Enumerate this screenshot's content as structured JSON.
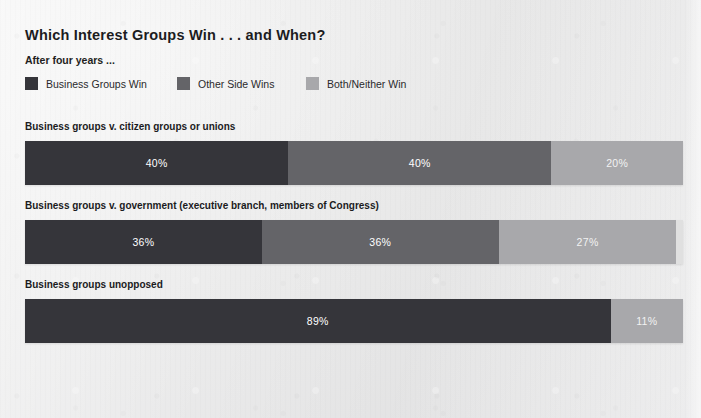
{
  "header": {
    "title": "Which Interest Groups Win . . . and When?",
    "subtitle": "After four years ..."
  },
  "legend": [
    {
      "label": "Business Groups Win",
      "color": "#35353a",
      "key": "business"
    },
    {
      "label": "Other Side Wins",
      "color": "#646468",
      "key": "other"
    },
    {
      "label": "Both/Neither Win",
      "color": "#a8a8ab",
      "key": "both"
    }
  ],
  "groups": [
    {
      "label": "Business groups v. citizen groups or unions",
      "segments": [
        {
          "key": "business",
          "value": 40,
          "label": "40%",
          "color": "#35353a"
        },
        {
          "key": "other",
          "value": 40,
          "label": "40%",
          "color": "#646468"
        },
        {
          "key": "both",
          "value": 20,
          "label": "20%",
          "color": "#a8a8ab"
        }
      ]
    },
    {
      "label": "Business groups v. government (executive branch, members of Congress)",
      "segments": [
        {
          "key": "business",
          "value": 36,
          "label": "36%",
          "color": "#35353a"
        },
        {
          "key": "other",
          "value": 36,
          "label": "36%",
          "color": "#646468"
        },
        {
          "key": "both",
          "value": 27,
          "label": "27%",
          "color": "#a8a8ab"
        }
      ]
    },
    {
      "label": "Business groups unopposed",
      "segments": [
        {
          "key": "business",
          "value": 89,
          "label": "89%",
          "color": "#35353a"
        },
        {
          "key": "both",
          "value": 11,
          "label": "11%",
          "color": "#a8a8ab"
        }
      ]
    }
  ],
  "chart_data": {
    "type": "bar",
    "title": "Which Interest Groups Win . . . and When?",
    "subtitle": "After four years ...",
    "orientation": "horizontal-stacked",
    "xlabel": "",
    "ylabel": "",
    "xlim": [
      0,
      100
    ],
    "grid": false,
    "legend_position": "top",
    "units": "percent",
    "categories": [
      "Business groups v. citizen groups or unions",
      "Business groups v. government (executive branch, members of Congress)",
      "Business groups unopposed"
    ],
    "series": [
      {
        "name": "Business Groups Win",
        "color": "#35353a",
        "values": [
          40,
          36,
          89
        ]
      },
      {
        "name": "Other Side Wins",
        "color": "#646468",
        "values": [
          40,
          36,
          null
        ]
      },
      {
        "name": "Both/Neither Win",
        "color": "#a8a8ab",
        "values": [
          20,
          27,
          11
        ]
      }
    ],
    "data_labels": [
      [
        "40%",
        "40%",
        "20%"
      ],
      [
        "36%",
        "36%",
        "27%"
      ],
      [
        "89%",
        "11%"
      ]
    ],
    "row_totals": [
      100,
      99,
      100
    ]
  }
}
